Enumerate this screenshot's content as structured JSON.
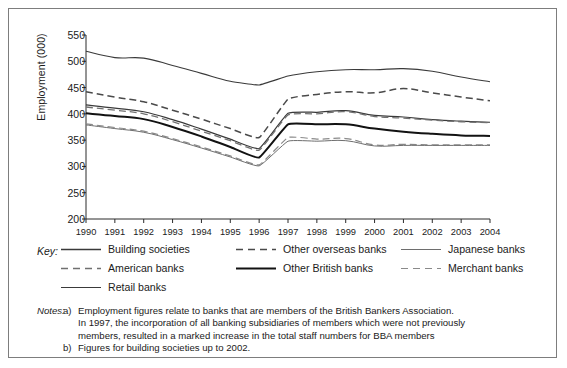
{
  "figure": {
    "key_label": "Key:",
    "notes_label": "Notes:",
    "notes": [
      {
        "marker": "a)",
        "lines": [
          "Employment figures relate to banks that are members of the British Bankers Association.",
          "In 1997, the incorporation of all banking subsidiaries of members which were not previously",
          "members, resulted in a marked increase in the total staff numbers for BBA members"
        ]
      },
      {
        "marker": "b)",
        "lines": [
          "Figures for building societies up to 2002."
        ]
      }
    ]
  },
  "chart_data": {
    "type": "line",
    "title": "",
    "xlabel": "",
    "ylabel": "Employment (000)",
    "ylim": [
      200,
      550
    ],
    "ytick_values": [
      200,
      250,
      300,
      350,
      400,
      450,
      500,
      550
    ],
    "ytick_labels": [
      "200",
      "250",
      "300",
      "350",
      "400",
      "450",
      "500",
      "550"
    ],
    "grid": false,
    "legend_position": "below-plot",
    "categories": [
      1990,
      1991,
      1992,
      1993,
      1994,
      1995,
      1996,
      1997,
      1998,
      1999,
      2000,
      2001,
      2002,
      2003,
      2004
    ],
    "xtick_labels": [
      "1990",
      "1991",
      "1992",
      "1993",
      "1994",
      "1995",
      "1996",
      "1997",
      "1998",
      "1999",
      "2000",
      "2001",
      "2002",
      "2003",
      "2004"
    ],
    "series": [
      {
        "name": "Retail banks",
        "style": "solid",
        "width": 1.1,
        "color": "#3a3a3a",
        "values": [
          519,
          507,
          506,
          492,
          477,
          462,
          455,
          472,
          480,
          484,
          484,
          486,
          481,
          470,
          461
        ]
      },
      {
        "name": "Other overseas banks",
        "style": "dashed",
        "width": 1.5,
        "color": "#4a4a4a",
        "values": [
          442,
          432,
          423,
          407,
          390,
          372,
          355,
          428,
          437,
          442,
          440,
          448,
          440,
          432,
          425
        ]
      },
      {
        "name": "Building societies",
        "style": "solid",
        "width": 1.2,
        "color": "#3a3a3a",
        "values": [
          417,
          411,
          404,
          389,
          371,
          352,
          334,
          401,
          403,
          406,
          397,
          394,
          389,
          386,
          384
        ]
      },
      {
        "name": "American banks",
        "style": "dashed",
        "width": 1.3,
        "color": "#707070",
        "values": [
          413,
          407,
          400,
          385,
          367,
          349,
          331,
          398,
          400,
          404,
          395,
          392,
          388,
          385,
          383
        ]
      },
      {
        "name": "Other British banks",
        "style": "solid",
        "width": 2.0,
        "color": "#121212",
        "values": [
          401,
          396,
          390,
          375,
          357,
          337,
          317,
          380,
          380,
          380,
          372,
          366,
          362,
          359,
          358
        ]
      },
      {
        "name": "Merchant banks",
        "style": "dashed",
        "width": 1.2,
        "color": "#8a8a8a",
        "values": [
          381,
          374,
          367,
          353,
          337,
          320,
          303,
          355,
          352,
          353,
          341,
          342,
          341,
          341,
          341
        ]
      },
      {
        "name": "Japanese banks",
        "style": "solid",
        "width": 1.0,
        "color": "#6e6e6e",
        "values": [
          379,
          372,
          365,
          351,
          335,
          318,
          301,
          348,
          348,
          349,
          339,
          340,
          340,
          340,
          340
        ]
      }
    ],
    "legend": [
      {
        "label": "Building societies",
        "style": "solid",
        "width": 1.3,
        "color": "#3a3a3a"
      },
      {
        "label": "Other overseas banks",
        "style": "dashed",
        "width": 1.5,
        "color": "#4a4a4a"
      },
      {
        "label": "Japanese banks",
        "style": "solid",
        "width": 1.0,
        "color": "#6e6e6e"
      },
      {
        "label": "American banks",
        "style": "dashed",
        "width": 1.3,
        "color": "#707070"
      },
      {
        "label": "Other British banks",
        "style": "solid",
        "width": 2.2,
        "color": "#121212"
      },
      {
        "label": "Merchant banks",
        "style": "dashed",
        "width": 1.2,
        "color": "#8a8a8a"
      },
      {
        "label": "Retail banks",
        "style": "solid",
        "width": 1.1,
        "color": "#3a3a3a"
      }
    ]
  }
}
